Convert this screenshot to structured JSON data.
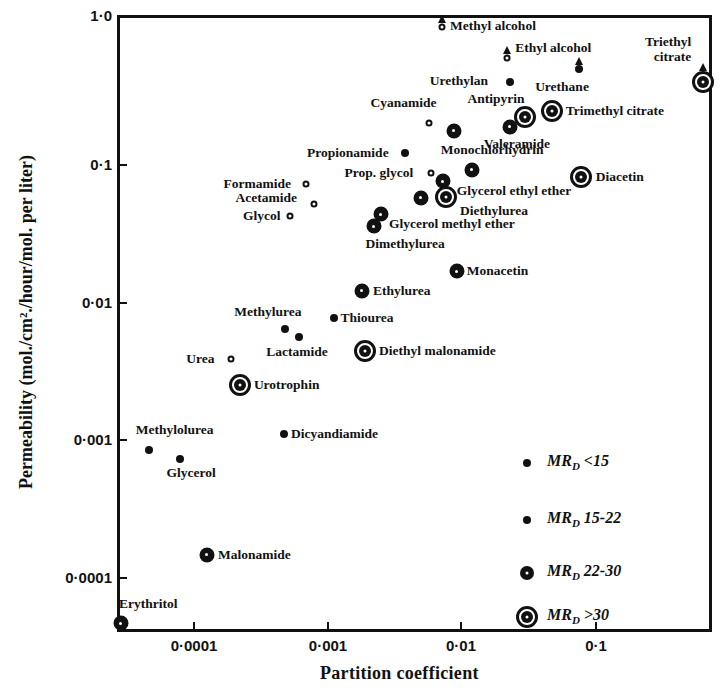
{
  "chart_data": {
    "type": "scatter",
    "title": "",
    "xlabel": "Partition coefficient",
    "ylabel": "Permeability (mol./cm²./hour/mol. per liter)",
    "xscale": "log",
    "yscale": "log",
    "xlim": [
      2.67e-05,
      0.73
    ],
    "ylim": [
      4.07e-05,
      1.0
    ],
    "x_ticks": [
      {
        "value": 0.0001,
        "label": "0·0001"
      },
      {
        "value": 0.001,
        "label": "0·001"
      },
      {
        "value": 0.01,
        "label": "0·01"
      },
      {
        "value": 0.1,
        "label": "0·1"
      }
    ],
    "y_ticks": [
      {
        "value": 1.0,
        "label": "1·0"
      },
      {
        "value": 0.1,
        "label": "0·1"
      },
      {
        "value": 0.01,
        "label": "0·01"
      },
      {
        "value": 0.001,
        "label": "0·001"
      },
      {
        "value": 0.0001,
        "label": "0·0001"
      }
    ],
    "grid": false,
    "legend_position": "lower right inside",
    "legend": [
      {
        "marker": "small-open",
        "label": "MR",
        "sub": "D",
        "range": "<15"
      },
      {
        "marker": "small-filled",
        "label": "MR",
        "sub": "D",
        "range": "15-22"
      },
      {
        "marker": "large-filled",
        "label": "MR",
        "sub": "D",
        "range": "22-30"
      },
      {
        "marker": "double-ring",
        "label": "MR",
        "sub": "D",
        "range": ">30"
      }
    ],
    "series": [
      {
        "name": "Methyl alcohol",
        "x": 0.0072,
        "y": 0.85,
        "class": "m1",
        "arrow": true,
        "label_dx": 8,
        "label_dy": -9
      },
      {
        "name": "Ethyl alcohol",
        "x": 0.022,
        "y": 0.52,
        "class": "m1",
        "arrow": true,
        "label_dx": 8,
        "label_dy": -18
      },
      {
        "name": "Urethylan",
        "x": 0.023,
        "y": 0.36,
        "class": "m2",
        "label_dx": -80,
        "label_dy": -9
      },
      {
        "name": "Urethane",
        "x": 0.075,
        "y": 0.44,
        "class": "m2",
        "arrow": true,
        "label_dx": -44,
        "label_dy": 10
      },
      {
        "name": "Triethyl citrate",
        "x": 0.62,
        "y": 0.36,
        "class": "m4",
        "arrow": true,
        "label_multiline": [
          "Triethyl",
          "citrate"
        ],
        "label_dx": -58,
        "label_dy": -48
      },
      {
        "name": "Antipyrin",
        "x": 0.03,
        "y": 0.21,
        "class": "m4",
        "label_dx": -58,
        "label_dy": -26
      },
      {
        "name": "Trimethyl citrate",
        "x": 0.047,
        "y": 0.23,
        "class": "m4",
        "label_dx": 14,
        "label_dy": -8
      },
      {
        "name": "Valeramide",
        "x": 0.023,
        "y": 0.18,
        "class": "m3",
        "label_dx": -26,
        "label_dy": 9
      },
      {
        "name": "Cyanamide",
        "x": 0.0057,
        "y": 0.19,
        "class": "m1",
        "label_dx": -58,
        "label_dy": -28
      },
      {
        "name": "(unlabeled)",
        "x": 0.0088,
        "y": 0.17,
        "class": "m3",
        "label_dx": 0,
        "label_dy": 0,
        "hide_label": true
      },
      {
        "name": "Propionamide",
        "x": 0.0038,
        "y": 0.12,
        "class": "m2",
        "label_dx": -98,
        "label_dy": -8
      },
      {
        "name": "Monochlorhydrin",
        "x": 0.012,
        "y": 0.092,
        "class": "m3",
        "label_dx": -31,
        "label_dy": -28
      },
      {
        "name": "Prop. glycol",
        "x": 0.0059,
        "y": 0.088,
        "class": "m1",
        "label_dx": -86,
        "label_dy": -8
      },
      {
        "name": "Diacetin",
        "x": 0.077,
        "y": 0.082,
        "class": "m4",
        "label_dx": 15,
        "label_dy": -8
      },
      {
        "name": "Glycerol ethyl ether",
        "x": 0.0073,
        "y": 0.076,
        "class": "m3",
        "label_dx": 14,
        "label_dy": 2
      },
      {
        "name": "Diethylurea",
        "x": 0.0077,
        "y": 0.059,
        "class": "m4",
        "label_dx": 14,
        "label_dy": 6
      },
      {
        "name": "(unlabeled)",
        "x": 0.005,
        "y": 0.058,
        "class": "m3",
        "hide_label": true
      },
      {
        "name": "Formamide",
        "x": 0.00068,
        "y": 0.073,
        "class": "m1",
        "label_dx": -82,
        "label_dy": -8
      },
      {
        "name": "Acetamide",
        "x": 0.00078,
        "y": 0.052,
        "class": "m1",
        "label_dx": -78,
        "label_dy": -14
      },
      {
        "name": "Glycol",
        "x": 0.00052,
        "y": 0.043,
        "class": "m1",
        "label_dx": -47,
        "label_dy": -8
      },
      {
        "name": "Glycerol methyl ether",
        "x": 0.0025,
        "y": 0.044,
        "class": "m3",
        "label_dx": 8,
        "label_dy": 2
      },
      {
        "name": "Dimethylurea",
        "x": 0.0022,
        "y": 0.036,
        "class": "m3",
        "label_dx": -8,
        "label_dy": 10
      },
      {
        "name": "Monacetin",
        "x": 0.0093,
        "y": 0.017,
        "class": "m3",
        "label_dx": 10,
        "label_dy": -8
      },
      {
        "name": "Ethylurea",
        "x": 0.0018,
        "y": 0.0123,
        "class": "m3",
        "label_dx": 11,
        "label_dy": -8
      },
      {
        "name": "Methylurea",
        "x": 0.00048,
        "y": 0.0065,
        "class": "m2",
        "label_dx": -51,
        "label_dy": -25
      },
      {
        "name": "Thiourea",
        "x": 0.0011,
        "y": 0.0078,
        "class": "m2",
        "label_dx": 7,
        "label_dy": -8
      },
      {
        "name": "Lactamide",
        "x": 0.00061,
        "y": 0.0056,
        "class": "m2",
        "label_dx": -33,
        "label_dy": 7
      },
      {
        "name": "Urea",
        "x": 0.00019,
        "y": 0.0039,
        "class": "m1",
        "label_dx": -45,
        "label_dy": -8
      },
      {
        "name": "Diethyl malonamide",
        "x": 0.0019,
        "y": 0.0045,
        "class": "m4",
        "label_dx": 14,
        "label_dy": -8
      },
      {
        "name": "Urotrophin",
        "x": 0.00022,
        "y": 0.0025,
        "class": "m4",
        "label_dx": 14,
        "label_dy": -8
      },
      {
        "name": "Methylolurea",
        "x": 4.6e-05,
        "y": 0.00085,
        "class": "m2",
        "label_dx": -13,
        "label_dy": -28
      },
      {
        "name": "Glycerol",
        "x": 7.8e-05,
        "y": 0.00073,
        "class": "m2",
        "label_dx": -13,
        "label_dy": 6
      },
      {
        "name": "Dicyandiamide",
        "x": 0.00047,
        "y": 0.0011,
        "class": "m2",
        "label_dx": 7,
        "label_dy": -8
      },
      {
        "name": "Malonamide",
        "x": 0.000125,
        "y": 0.000148,
        "class": "m3",
        "label_dx": 11,
        "label_dy": -8
      },
      {
        "name": "Erythritol",
        "x": 2.85e-05,
        "y": 4.7e-05,
        "class": "m3",
        "label_dx": -2,
        "label_dy": -27
      }
    ]
  }
}
